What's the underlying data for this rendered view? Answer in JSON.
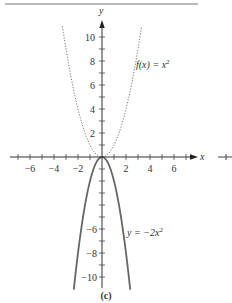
{
  "chart_data": {
    "type": "line",
    "title": "",
    "caption": "(c)",
    "xlabel": "x",
    "ylabel": "y",
    "xlim": [
      -8,
      8
    ],
    "ylim": [
      -11,
      11
    ],
    "grid": false,
    "x_ticks": [
      -6,
      -4,
      -2,
      2,
      4,
      6
    ],
    "x_tick_labels": [
      "−6",
      "−4",
      "−2",
      "2",
      "4",
      "6"
    ],
    "y_ticks": [
      10,
      8,
      6,
      4,
      2,
      -6,
      -8,
      -10
    ],
    "y_tick_labels": [
      "10",
      "8",
      "6",
      "4",
      "2",
      "−6",
      "−8",
      "−10"
    ],
    "series": [
      {
        "name": "f(x) = x²",
        "style": "dotted",
        "expression": "x^2",
        "x": [
          -3.3,
          -3,
          -2.5,
          -2,
          -1.5,
          -1,
          -0.5,
          0,
          0.5,
          1,
          1.5,
          2,
          2.5,
          3,
          3.3
        ],
        "values": [
          10.89,
          9,
          6.25,
          4,
          2.25,
          1,
          0.25,
          0,
          0.25,
          1,
          2.25,
          4,
          6.25,
          9,
          10.89
        ]
      },
      {
        "name": "y = −2x²",
        "style": "solid",
        "expression": "-2x^2",
        "x": [
          -2.35,
          -2,
          -1.5,
          -1,
          -0.5,
          0,
          0.5,
          1,
          1.5,
          2,
          2.35
        ],
        "values": [
          -11.05,
          -8,
          -4.5,
          -2,
          -0.5,
          0,
          -0.5,
          -2,
          -4.5,
          -8,
          -11.05
        ]
      }
    ],
    "annotations": [
      {
        "text_parts": [
          "f(x) = x",
          "2"
        ],
        "near": "dotted curve, upper right"
      },
      {
        "text_parts": [
          "y = −2x",
          "2"
        ],
        "near": "solid curve, lower right"
      }
    ]
  },
  "labels": {
    "x_axis": "x",
    "y_axis": "y",
    "caption": "(c)",
    "f_eq_main": "f(x) = x",
    "f_eq_exp": "2",
    "g_eq_main": "y = −2x",
    "g_eq_exp": "2",
    "xt": [
      "−6",
      "−4",
      "−2",
      "2",
      "4",
      "6"
    ],
    "yt": [
      "10",
      "8",
      "6",
      "4",
      "2",
      "−6",
      "−8",
      "−10"
    ]
  },
  "colors": {
    "axis": "#333333",
    "dotted_curve": "#777777",
    "solid_curve": "#666666",
    "top_rule": "#777777"
  }
}
